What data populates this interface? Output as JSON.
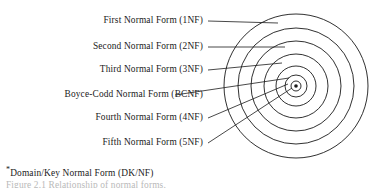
{
  "figure": {
    "type": "concentric-rings-diagram",
    "title_caption": "Figure 2.1  Relationship of normal forms.",
    "background_color": "#ffffff",
    "line_color": "#1a1a1a",
    "text_color": "#1a1a1a"
  },
  "labels": [
    {
      "id": "1nf",
      "text": "First Normal Form (1NF)",
      "ring": 1,
      "x": 203,
      "y": 21,
      "leader_end_x": 278,
      "leader_end_y": 23
    },
    {
      "id": "2nf",
      "text": "Second Normal Form (2NF)",
      "ring": 2,
      "x": 203,
      "y": 47,
      "leader_end_x": 285,
      "leader_end_y": 47
    },
    {
      "id": "3nf",
      "text": "Third Normal Form (3NF)",
      "ring": 3,
      "x": 203,
      "y": 70,
      "leader_end_x": 282,
      "leader_end_y": 63
    },
    {
      "id": "bcnf",
      "text": "Boyce-Codd Normal Form (BCNF)",
      "ring": 4,
      "x": 170,
      "y": 95,
      "leader_end_x": 289,
      "leader_end_y": 78
    },
    {
      "id": "4nf",
      "text": "Fourth Normal Form (4NF)",
      "ring": 5,
      "x": 203,
      "y": 118,
      "leader_end_x": 288,
      "leader_end_y": 84
    },
    {
      "id": "5nf",
      "text": "Fifth Normal Form (5NF)",
      "ring": 6,
      "x": 203,
      "y": 143,
      "leader_end_x": 292,
      "leader_end_y": 88
    }
  ],
  "footnote": {
    "marker": "*",
    "text": "Domain/Key Normal Form (DK/NF)",
    "x": 6,
    "y": 172
  },
  "caption": {
    "text": "Figure 2.1  Relationship of normal forms.",
    "x": 6,
    "y": 186
  },
  "chart_data": {
    "type": "diagram",
    "center": {
      "cx": 296,
      "cy": 86
    },
    "rings": [
      {
        "level": 1,
        "name": "First Normal Form (1NF)",
        "abbr": "1NF",
        "r": 72
      },
      {
        "level": 2,
        "name": "Second Normal Form (2NF)",
        "abbr": "2NF",
        "r": 58
      },
      {
        "level": 3,
        "name": "Third Normal Form (3NF)",
        "abbr": "3NF",
        "r": 45
      },
      {
        "level": 4,
        "name": "Boyce-Codd Normal Form (BCNF)",
        "abbr": "BCNF",
        "r": 32
      },
      {
        "level": 5,
        "name": "Fourth Normal Form (4NF)",
        "abbr": "4NF",
        "r": 20
      },
      {
        "level": 6,
        "name": "Fifth Normal Form (5NF)",
        "abbr": "5NF",
        "r": 11
      },
      {
        "level": 7,
        "name": "Domain/Key Normal Form (DK/NF)",
        "abbr": "DK/NF",
        "r": 5
      }
    ],
    "center_dot_r": 1.8,
    "title": "Relationship of normal forms"
  }
}
